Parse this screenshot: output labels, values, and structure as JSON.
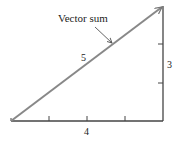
{
  "diagram": {
    "type": "vector-addition-right-triangle",
    "labels": {
      "hypotenuse_caption": "Vector sum",
      "hypotenuse_length": "5",
      "horizontal_length": "4",
      "vertical_length": "3"
    },
    "components": {
      "horizontal": {
        "length": 4,
        "tick_count": 3
      },
      "vertical": {
        "length": 3,
        "tick_count": 2
      },
      "resultant": {
        "length": 5
      }
    },
    "colors": {
      "resultant": "#888888",
      "legs": "#444444",
      "text": "#222222",
      "background": "#ffffff"
    }
  }
}
